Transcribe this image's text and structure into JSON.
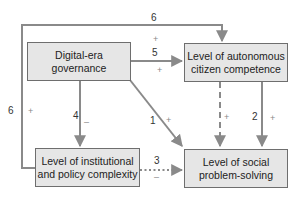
{
  "nodes": {
    "digital": {
      "label": "Digital-era governance"
    },
    "autonomous": {
      "label": "Level of autonomous citizen competence"
    },
    "institutional": {
      "label": "Level of institutional and policy complexity"
    },
    "social": {
      "label": "Level of social problem-solving"
    }
  },
  "edges": [
    {
      "id": "1",
      "from": "digital",
      "to": "social",
      "number": "1",
      "sign": "+",
      "style": "solid"
    },
    {
      "id": "2",
      "from": "autonomous",
      "to": "social",
      "number": "2",
      "sign": "+",
      "style": "solid"
    },
    {
      "id": "3",
      "from": "institutional",
      "to": "social",
      "number": "3",
      "sign": "–",
      "style": "dotted"
    },
    {
      "id": "4",
      "from": "digital",
      "to": "institutional",
      "number": "4",
      "sign": "–",
      "style": "solid"
    },
    {
      "id": "5",
      "from": "digital",
      "to": "autonomous",
      "number": "5",
      "sign": "+",
      "style": "solid"
    },
    {
      "id": "6",
      "from": "institutional",
      "to": "autonomous",
      "number": "6",
      "sign": "+",
      "style": "solid",
      "extra_number": "6",
      "extra_sign": "+"
    },
    {
      "id": "dashed",
      "from": "autonomous",
      "to": "social",
      "number": "",
      "sign": "+",
      "style": "dashed"
    }
  ],
  "colors": {
    "line": "#8a8a8a",
    "box_fill": "#e6e6e6",
    "box_border": "#6e6e6e"
  }
}
